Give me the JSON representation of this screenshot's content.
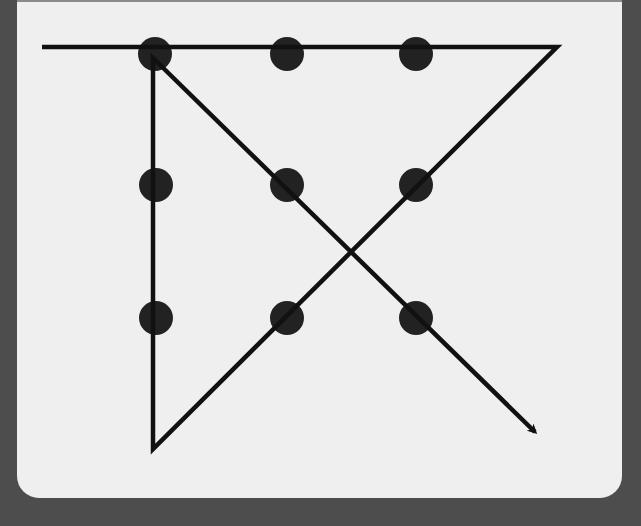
{
  "diagram": {
    "type": "nine-dot-puzzle-solution",
    "colors": {
      "background": "#4d4d4d",
      "panel": "#efefef",
      "dot": "#222222",
      "line": "#111111"
    },
    "dots": [
      {
        "row": 1,
        "col": 1,
        "cx": 155,
        "cy": 54
      },
      {
        "row": 1,
        "col": 2,
        "cx": 287,
        "cy": 54
      },
      {
        "row": 1,
        "col": 3,
        "cx": 416,
        "cy": 54
      },
      {
        "row": 2,
        "col": 1,
        "cx": 156,
        "cy": 185
      },
      {
        "row": 2,
        "col": 2,
        "cx": 287,
        "cy": 185
      },
      {
        "row": 2,
        "col": 3,
        "cx": 416,
        "cy": 185
      },
      {
        "row": 3,
        "col": 1,
        "cx": 156,
        "cy": 318
      },
      {
        "row": 3,
        "col": 2,
        "cx": 287,
        "cy": 318
      },
      {
        "row": 3,
        "col": 3,
        "cx": 416,
        "cy": 318
      }
    ],
    "dot_radius": 17,
    "path": {
      "segments": 4,
      "points": [
        [
          42,
          47
        ],
        [
          557,
          47
        ],
        [
          153,
          449
        ],
        [
          153,
          58
        ],
        [
          535,
          432
        ]
      ],
      "ends_with_arrow": true
    }
  }
}
